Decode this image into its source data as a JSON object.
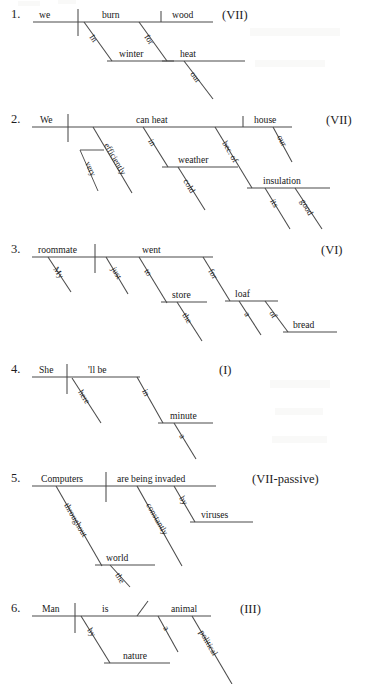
{
  "page": {
    "background": "#ffffff",
    "ink": "#1a1a1a",
    "line_color": "#4a4a4a"
  },
  "diagrams": [
    {
      "number": "1.",
      "pattern": "(VII)",
      "subject": "we",
      "verb": "burn",
      "object": "wood",
      "words": [
        "we",
        "burn",
        "wood",
        "In",
        "winter",
        "for",
        "heat",
        "our"
      ],
      "modifiers": [
        {
          "word": "In",
          "attaches_to": "burn",
          "object": "winter"
        },
        {
          "word": "winter",
          "attaches_to": "In"
        },
        {
          "word": "for",
          "attaches_to": "burn",
          "object": "heat"
        },
        {
          "word": "heat",
          "attaches_to": "for"
        },
        {
          "word": "our",
          "attaches_to": "heat"
        }
      ]
    },
    {
      "number": "2.",
      "pattern": "(VII)",
      "subject": "We",
      "verb": "can heat",
      "object": "house",
      "words": [
        "We",
        "can heat",
        "house",
        "very",
        "efficiently",
        "in",
        "weather",
        "cold",
        "bec. of",
        "our",
        "insulation",
        "its",
        "good"
      ],
      "modifiers": [
        {
          "word": "efficiently",
          "attaches_to": "can heat"
        },
        {
          "word": "very",
          "attaches_to": "efficiently"
        },
        {
          "word": "in",
          "attaches_to": "can heat",
          "object": "weather"
        },
        {
          "word": "weather",
          "attaches_to": "in"
        },
        {
          "word": "cold",
          "attaches_to": "weather"
        },
        {
          "word": "bec. of",
          "attaches_to": "can heat",
          "object": "insulation"
        },
        {
          "word": "insulation",
          "attaches_to": "bec. of"
        },
        {
          "word": "its",
          "attaches_to": "insulation"
        },
        {
          "word": "good",
          "attaches_to": "insulation"
        },
        {
          "word": "our",
          "attaches_to": "house"
        }
      ]
    },
    {
      "number": "3.",
      "pattern": "(VI)",
      "subject": "roommate",
      "verb": "went",
      "object": "",
      "words": [
        "roommate",
        "went",
        "My",
        "just",
        "to",
        "store",
        "the",
        "for",
        "loaf",
        "a",
        "of",
        "bread"
      ],
      "modifiers": [
        {
          "word": "My",
          "attaches_to": "roommate"
        },
        {
          "word": "just",
          "attaches_to": "went"
        },
        {
          "word": "to",
          "attaches_to": "went",
          "object": "store"
        },
        {
          "word": "store",
          "attaches_to": "to"
        },
        {
          "word": "the",
          "attaches_to": "store"
        },
        {
          "word": "for",
          "attaches_to": "went",
          "object": "loaf"
        },
        {
          "word": "loaf",
          "attaches_to": "for"
        },
        {
          "word": "a",
          "attaches_to": "loaf"
        },
        {
          "word": "of",
          "attaches_to": "loaf",
          "object": "bread"
        },
        {
          "word": "bread",
          "attaches_to": "of"
        }
      ]
    },
    {
      "number": "4.",
      "pattern": "(I)",
      "subject": "She",
      "verb": "'ll be",
      "object": "",
      "words": [
        "She",
        "'ll be",
        "here",
        "in",
        "minute",
        "a"
      ],
      "modifiers": [
        {
          "word": "here",
          "attaches_to": "'ll be"
        },
        {
          "word": "in",
          "attaches_to": "'ll be",
          "object": "minute"
        },
        {
          "word": "minute",
          "attaches_to": "in"
        },
        {
          "word": "a",
          "attaches_to": "minute"
        }
      ]
    },
    {
      "number": "5.",
      "pattern": "(VII-passive)",
      "subject": "Computers",
      "verb": "are being invaded",
      "object": "",
      "words": [
        "Computers",
        "are being invaded",
        "throughout",
        "world",
        "the",
        "constantly",
        "by",
        "viruses"
      ],
      "modifiers": [
        {
          "word": "throughout",
          "attaches_to": "Computers",
          "object": "world"
        },
        {
          "word": "world",
          "attaches_to": "throughout"
        },
        {
          "word": "the",
          "attaches_to": "world"
        },
        {
          "word": "constantly",
          "attaches_to": "are being invaded"
        },
        {
          "word": "by",
          "attaches_to": "are being invaded",
          "object": "viruses"
        },
        {
          "word": "viruses",
          "attaches_to": "by"
        }
      ]
    },
    {
      "number": "6.",
      "pattern": "(III)",
      "subject": "Man",
      "verb": "is",
      "object": "animal",
      "words": [
        "Man",
        "is",
        "animal",
        "by",
        "nature",
        "a",
        "political"
      ],
      "modifiers": [
        {
          "word": "by",
          "attaches_to": "is",
          "object": "nature"
        },
        {
          "word": "nature",
          "attaches_to": "by"
        },
        {
          "word": "a",
          "attaches_to": "animal"
        },
        {
          "word": "political",
          "attaches_to": "animal"
        }
      ]
    }
  ]
}
